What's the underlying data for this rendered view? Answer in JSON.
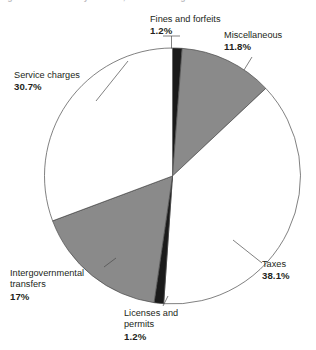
{
  "caption": {
    "text": "Figure  Sources of city revenue, selected categories"
  },
  "chart_data": {
    "type": "pie",
    "title": "",
    "subtitle": "",
    "xlabel": "",
    "ylabel": "",
    "legend_position": "none",
    "grid": false,
    "units": "percent",
    "total": 100,
    "categories": [
      "Fines and forfeits",
      "Miscellaneous",
      "Taxes",
      "Licenses and permits",
      "Intergovernmental transfers",
      "Service charges"
    ],
    "values": [
      1.2,
      11.8,
      38.1,
      1.2,
      17,
      30.7
    ],
    "value_labels": [
      "1.2%",
      "11.8%",
      "38.1%",
      "1.2%",
      "17%",
      "30.7%"
    ],
    "slice_colors": [
      "#1a1a1a",
      "#8a8a8a",
      "#ffffff",
      "#1a1a1a",
      "#8a8a8a",
      "#ffffff"
    ],
    "start_angle_deg": 0,
    "direction": "clockwise",
    "slices": [
      {
        "name": "Fines and forfeits",
        "value": 1.2,
        "label": "1.2%",
        "color": "#1a1a1a"
      },
      {
        "name": "Miscellaneous",
        "value": 11.8,
        "label": "11.8%",
        "color": "#8a8a8a"
      },
      {
        "name": "Taxes",
        "value": 38.1,
        "label": "38.1%",
        "color": "#ffffff"
      },
      {
        "name": "Licenses and permits",
        "value": 1.2,
        "label": "1.2%",
        "color": "#1a1a1a"
      },
      {
        "name": "Intergovernmental transfers",
        "value": 17,
        "label": "17%",
        "color": "#8a8a8a"
      },
      {
        "name": "Service charges",
        "value": 30.7,
        "label": "30.7%",
        "color": "#ffffff"
      }
    ]
  },
  "labels": {
    "fines": {
      "name_line1": "Fines and forfeits",
      "pct": "1.2%"
    },
    "misc": {
      "name_line1": "Miscellaneous",
      "pct": "11.8%"
    },
    "service": {
      "name_line1": "Service charges",
      "pct": "30.7%"
    },
    "taxes": {
      "name_line1": "Taxes",
      "pct": "38.1%"
    },
    "intergov": {
      "name_line1": "Intergovernmental",
      "name_line2": "transfers",
      "pct": "17%"
    },
    "licenses": {
      "name_line1": "Licenses and",
      "name_line2": "permits",
      "pct": "1.2%"
    }
  },
  "style": {
    "gray": "#8a8a8a",
    "black": "#1a1a1a",
    "white": "#ffffff",
    "outline": "#4a4a4a",
    "text": "#231f20"
  }
}
